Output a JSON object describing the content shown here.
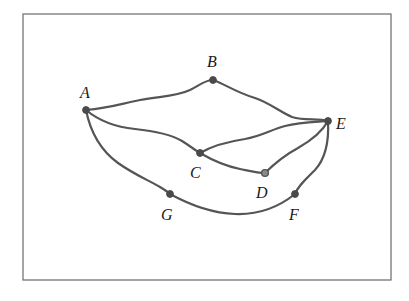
{
  "diagram": {
    "type": "graph",
    "directed": false,
    "frame": {
      "x": 23,
      "y": 14,
      "width": 368,
      "height": 266
    },
    "nodes": [
      {
        "id": "A",
        "label": "A",
        "x": 86,
        "y": 110,
        "label_x": 80,
        "label_y": 98
      },
      {
        "id": "B",
        "label": "B",
        "x": 213,
        "y": 80,
        "label_x": 207,
        "label_y": 67
      },
      {
        "id": "C",
        "label": "C",
        "x": 200,
        "y": 153,
        "label_x": 190,
        "label_y": 178
      },
      {
        "id": "D",
        "label": "D",
        "x": 265,
        "y": 173,
        "label_x": 256,
        "label_y": 198
      },
      {
        "id": "E",
        "label": "E",
        "x": 328,
        "y": 121,
        "label_x": 336,
        "label_y": 129
      },
      {
        "id": "F",
        "label": "F",
        "x": 295,
        "y": 194,
        "label_x": 289,
        "label_y": 220
      },
      {
        "id": "G",
        "label": "G",
        "x": 170,
        "y": 194,
        "label_x": 161,
        "label_y": 220
      }
    ],
    "edges": [
      {
        "from": "A",
        "to": "B",
        "path": "M86,110 C110,108 120,104 140,100 C160,96 175,97 190,90 C200,85 205,80 213,80"
      },
      {
        "from": "B",
        "to": "E",
        "path": "M213,80 C225,84 235,92 255,98 C270,103 280,112 292,117 C305,121 318,118 328,121"
      },
      {
        "from": "A",
        "to": "C",
        "path": "M86,110 C98,120 115,127 135,129 C155,131 170,134 182,141 C190,146 195,150 200,153"
      },
      {
        "from": "A",
        "to": "G",
        "path": "M86,110 C90,130 100,150 118,163 C135,175 150,181 160,187 C165,190 168,192 170,194"
      },
      {
        "from": "C",
        "to": "E",
        "path": "M200,153 C212,146 225,142 245,139 C262,136 270,130 285,126 C300,122 315,122 328,121"
      },
      {
        "from": "C",
        "to": "D",
        "path": "M200,153 C212,160 225,166 240,169 C250,171 258,173 265,173"
      },
      {
        "from": "D",
        "to": "E",
        "path": "M265,173 C275,163 285,155 298,148 C312,140 322,132 328,121"
      },
      {
        "from": "E",
        "to": "F",
        "path": "M328,121 C329,140 326,158 315,170 C305,180 298,186 295,194"
      },
      {
        "from": "G",
        "to": "F",
        "path": "M170,194 C190,205 210,213 235,214 C260,215 280,206 295,194"
      }
    ]
  }
}
